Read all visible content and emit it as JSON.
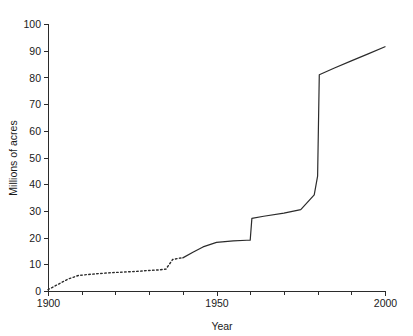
{
  "chart_data": {
    "type": "line",
    "title": "",
    "xlabel": "Year",
    "ylabel": "Millions of acres",
    "xlim": [
      1900,
      2000
    ],
    "ylim": [
      0,
      100
    ],
    "grid": false,
    "legend": null,
    "x_ticks_major": [
      1900,
      1950,
      2000
    ],
    "x_tick_labels": [
      "1900",
      "1950",
      "2000"
    ],
    "x_ticks_minor": [
      1910,
      1920,
      1930,
      1940,
      1960,
      1970,
      1980,
      1990
    ],
    "y_ticks": [
      0,
      10,
      20,
      30,
      40,
      50,
      60,
      70,
      80,
      90,
      100
    ],
    "y_tick_labels": [
      "0",
      "10",
      "20",
      "30",
      "40",
      "50",
      "60",
      "70",
      "80",
      "90",
      "100"
    ],
    "series": [
      {
        "name": "estimated-early-period",
        "style": "dotted",
        "x": [
          1900,
          1903,
          1906,
          1909,
          1912,
          1915,
          1918,
          1921,
          1924,
          1927,
          1930,
          1933,
          1935,
          1937,
          1939,
          1940
        ],
        "values": [
          0.5,
          2.5,
          4.5,
          5.8,
          6.2,
          6.5,
          6.8,
          7.0,
          7.2,
          7.4,
          7.7,
          7.9,
          8.2,
          11.8,
          12.3,
          12.4
        ]
      },
      {
        "name": "recorded-period",
        "style": "solid",
        "x": [
          1940,
          1943,
          1946,
          1950,
          1955,
          1959,
          1960,
          1960.5,
          1964,
          1970,
          1975,
          1979,
          1980,
          1980.5,
          1985,
          1990,
          1995,
          2000
        ],
        "values": [
          12.4,
          14.5,
          16.5,
          18.2,
          18.8,
          19.0,
          19.0,
          27.2,
          28.0,
          29.2,
          30.5,
          36.0,
          43.0,
          81.0,
          83.5,
          86.2,
          88.8,
          91.5
        ]
      }
    ],
    "annotations": []
  }
}
